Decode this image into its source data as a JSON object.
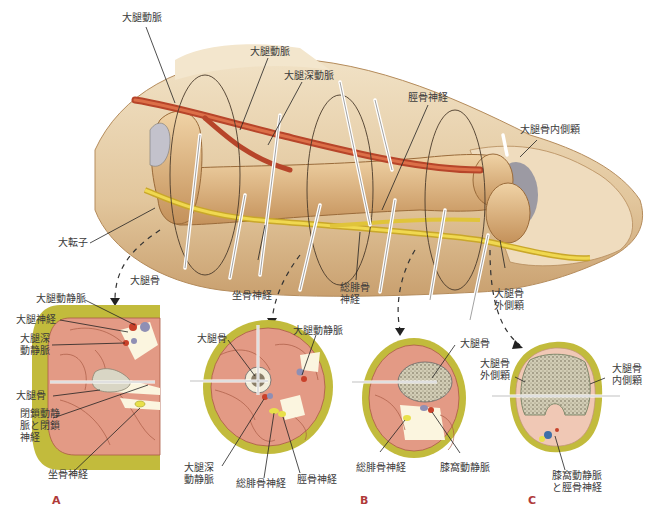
{
  "figure": {
    "colors": {
      "skin": "#e9d2ae",
      "skin_shadow": "#c89d6c",
      "bone": "#e0b985",
      "bone_shadow": "#b98650",
      "artery": "#c8502e",
      "nerve": "#e6c93a",
      "fat": "#c3bd3c",
      "muscle": "#e59a86",
      "muscle_line": "#b55a46",
      "marrow": "#d6d3c2",
      "vein": "#8f8fb4",
      "panel_letter": "#b03a3a",
      "label_text": "#3a3a3a"
    },
    "longitudinal_labels": {
      "femoral_artery_top": "大腿動脈",
      "femoral_artery": "大腿動脈",
      "deep_femoral_artery": "大腿深動脈",
      "tibial_nerve": "脛骨神経",
      "medial_condyle": "大腿骨内側顆",
      "greater_trochanter": "大転子",
      "femur": "大腿骨",
      "sciatic_nerve": "坐骨神経",
      "common_peroneal_nerve": "総腓骨神経",
      "lateral_condyle": "大腿骨外側顆"
    },
    "panel_a": {
      "letter": "A",
      "labels": {
        "femoral_vessels": "大腿動静脈",
        "femoral_nerve": "大腿神経",
        "deep_femoral_vessels": "大腿深動静脈",
        "femur": "大腿骨",
        "obturator": "閉鎖動静脈と閉鎖神経",
        "sciatic_nerve": "坐骨神経"
      }
    },
    "panel_b1": {
      "labels": {
        "femur": "大腿骨",
        "femoral_vessels": "大腿動静脈",
        "deep_femoral_vessels": "大腿深動静脈",
        "common_peroneal_nerve": "総腓骨神経",
        "tibial_nerve": "脛骨神経"
      }
    },
    "panel_b2": {
      "letter": "B",
      "labels": {
        "femur": "大腿骨",
        "common_peroneal_nerve": "総腓骨神経",
        "popliteal_vessels": "膝窩動静脈"
      }
    },
    "panel_c": {
      "letter": "C",
      "labels": {
        "lateral_condyle": "大腿骨外側顆",
        "medial_condyle": "大腿骨内側顆",
        "popliteal_tibial": "膝窩動静脈と脛骨神経"
      }
    }
  }
}
